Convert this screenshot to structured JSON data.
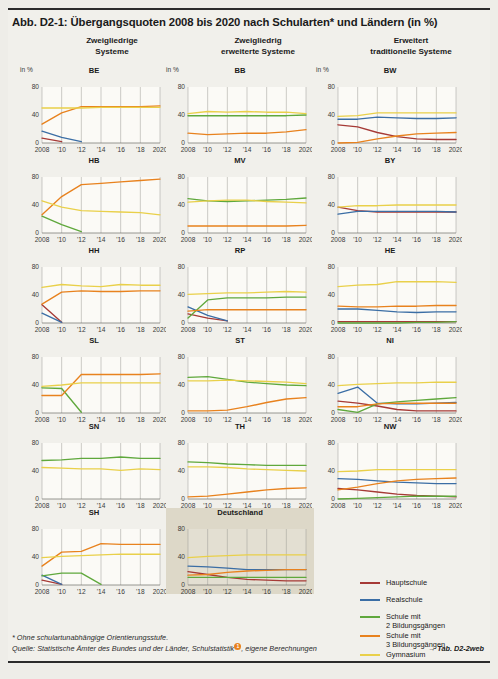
{
  "figure": {
    "title": "Abb. D2-1: Übergangsquoten 2008 bis 2020 nach Schularten* und Ländern (in %)",
    "column_headers": [
      "Zweigliedrige\nSysteme",
      "Zweigliedrig\nerweiterte Systeme",
      "Erweitert\ntraditionelle Systeme"
    ],
    "axis_unit_label": "in %",
    "y_ticks": [
      "0",
      "40",
      "80"
    ],
    "x_ticks": [
      "2008",
      "'10",
      "'12",
      "'14",
      "'16",
      "'18",
      "2020"
    ]
  },
  "legend": {
    "items": [
      {
        "label": "Hauptschule",
        "color": "#a63a36"
      },
      {
        "label": "Realschule",
        "color": "#3b6ea5"
      },
      {
        "label": "Schule mit\n2 Bildungsgängen",
        "color": "#5fa83c"
      },
      {
        "label": "Schule mit\n3 Bildungsgängen",
        "color": "#e8821e"
      },
      {
        "label": "Gymnasium",
        "color": "#e9d04a"
      }
    ]
  },
  "footer": {
    "note": "*  Ohne schulartunabhängige Orientierungsstufe.",
    "source_pre": "Quelle: Statistische Ämter des Bundes und der Länder, Schulstatistik",
    "source_marker": "1",
    "source_post": ", eigene Berechnungen",
    "link": "→ Tab. D2-2web"
  },
  "chart_data": {
    "type": "line",
    "xlabel": "",
    "ylabel": "in %",
    "x": [
      2008,
      2010,
      2012,
      2014,
      2016,
      2018,
      2020
    ],
    "xlim": [
      2008,
      2020
    ],
    "ylim": [
      0,
      80
    ],
    "yticks": [
      0,
      40,
      80
    ],
    "grid": "vertical",
    "legend_position": "right-bottom",
    "series_colors": {
      "Hauptschule": "#a63a36",
      "Realschule": "#3b6ea5",
      "Schule mit 2 Bildungsgängen": "#5fa83c",
      "Schule mit 3 Bildungsgängen": "#e8821e",
      "Gymnasium": "#e9d04a"
    },
    "panels": [
      {
        "name": "BE",
        "group": "Zweigliedrige Systeme",
        "series": [
          {
            "name": "Hauptschule",
            "values": [
              7,
              2,
              null,
              null,
              null,
              null,
              null
            ]
          },
          {
            "name": "Realschule",
            "values": [
              17,
              8,
              2,
              null,
              null,
              null,
              null
            ]
          },
          {
            "name": "Schule mit 3 Bildungsgängen",
            "values": [
              27,
              43,
              52,
              52,
              52,
              52,
              53
            ]
          },
          {
            "name": "Gymnasium",
            "values": [
              50,
              50,
              50,
              51,
              51,
              51,
              51
            ]
          }
        ]
      },
      {
        "name": "BB",
        "group": "Zweigliedrig erweiterte Systeme",
        "series": [
          {
            "name": "Schule mit 2 Bildungsgängen",
            "values": [
              39,
              39,
              39,
              39,
              39,
              39,
              40
            ]
          },
          {
            "name": "Schule mit 3 Bildungsgängen",
            "values": [
              14,
              12,
              13,
              14,
              14,
              16,
              19
            ]
          },
          {
            "name": "Gymnasium",
            "values": [
              42,
              45,
              44,
              45,
              44,
              44,
              42
            ]
          }
        ]
      },
      {
        "name": "BW",
        "group": "Erweitert traditionelle Systeme",
        "series": [
          {
            "name": "Hauptschule",
            "values": [
              26,
              23,
              15,
              9,
              6,
              5,
              5
            ]
          },
          {
            "name": "Realschule",
            "values": [
              34,
              34,
              37,
              36,
              35,
              35,
              36
            ]
          },
          {
            "name": "Schule mit 3 Bildungsgängen",
            "values": [
              0,
              1,
              6,
              10,
              13,
              14,
              15
            ]
          },
          {
            "name": "Gymnasium",
            "values": [
              38,
              39,
              43,
              43,
              43,
              43,
              43
            ]
          }
        ]
      },
      {
        "name": "HB",
        "group": "Zweigliedrige Systeme",
        "series": [
          {
            "name": "Schule mit 2 Bildungsgängen",
            "values": [
              24,
              12,
              2,
              null,
              null,
              null,
              null
            ]
          },
          {
            "name": "Schule mit 3 Bildungsgängen",
            "values": [
              26,
              52,
              69,
              71,
              73,
              75,
              77
            ]
          },
          {
            "name": "Gymnasium",
            "values": [
              46,
              37,
              32,
              31,
              30,
              29,
              26
            ]
          }
        ]
      },
      {
        "name": "MV",
        "group": "Zweigliedrig erweiterte Systeme",
        "series": [
          {
            "name": "Schule mit 2 Bildungsgängen",
            "values": [
              49,
              46,
              45,
              46,
              47,
              48,
              50
            ]
          },
          {
            "name": "Schule mit 3 Bildungsgängen",
            "values": [
              10,
              10,
              10,
              10,
              10,
              10,
              11
            ]
          },
          {
            "name": "Gymnasium",
            "values": [
              44,
              46,
              47,
              47,
              45,
              44,
              43
            ]
          }
        ]
      },
      {
        "name": "BY",
        "group": "Erweitert traditionelle Systeme",
        "series": [
          {
            "name": "Hauptschule",
            "values": [
              37,
              32,
              30,
              30,
              30,
              30,
              30
            ]
          },
          {
            "name": "Realschule",
            "values": [
              27,
              31,
              31,
              31,
              31,
              31,
              30
            ]
          },
          {
            "name": "Gymnasium",
            "values": [
              37,
              39,
              39,
              40,
              40,
              40,
              40
            ]
          }
        ]
      },
      {
        "name": "HH",
        "group": "Zweigliedrige Systeme",
        "series": [
          {
            "name": "Hauptschule",
            "values": [
              26,
              1,
              null,
              null,
              null,
              null,
              null
            ]
          },
          {
            "name": "Realschule",
            "values": [
              14,
              1,
              null,
              null,
              null,
              null,
              null
            ]
          },
          {
            "name": "Schule mit 3 Bildungsgängen",
            "values": [
              27,
              44,
              46,
              45,
              45,
              46,
              46
            ]
          },
          {
            "name": "Gymnasium",
            "values": [
              51,
              55,
              53,
              52,
              55,
              54,
              54
            ]
          }
        ]
      },
      {
        "name": "RP",
        "group": "Zweigliedrig erweiterte Systeme",
        "series": [
          {
            "name": "Hauptschule",
            "values": [
              13,
              7,
              3,
              null,
              null,
              null,
              null
            ]
          },
          {
            "name": "Realschule",
            "values": [
              23,
              11,
              3,
              null,
              null,
              null,
              null
            ]
          },
          {
            "name": "Schule mit 2 Bildungsgängen",
            "values": [
              7,
              33,
              36,
              36,
              36,
              37,
              37
            ]
          },
          {
            "name": "Schule mit 3 Bildungsgängen",
            "values": [
              17,
              19,
              19,
              19,
              19,
              19,
              19
            ]
          },
          {
            "name": "Gymnasium",
            "values": [
              41,
              42,
              43,
              43,
              44,
              45,
              44
            ]
          }
        ]
      },
      {
        "name": "HE",
        "group": "Erweitert traditionelle Systeme",
        "series": [
          {
            "name": "Hauptschule",
            "values": [
              2,
              2,
              2,
              2,
              2,
              2,
              2
            ]
          },
          {
            "name": "Realschule",
            "values": [
              20,
              20,
              18,
              16,
              15,
              16,
              16
            ]
          },
          {
            "name": "Schule mit 2 Bildungsgängen",
            "values": [
              0,
              0,
              0,
              0,
              1,
              1,
              2
            ]
          },
          {
            "name": "Schule mit 3 Bildungsgängen",
            "values": [
              24,
              23,
              23,
              24,
              24,
              25,
              25
            ]
          },
          {
            "name": "Gymnasium",
            "values": [
              52,
              54,
              55,
              59,
              59,
              59,
              58
            ]
          }
        ]
      },
      {
        "name": "SL",
        "group": "Zweigliedrige Systeme",
        "series": [
          {
            "name": "Schule mit 2 Bildungsgängen",
            "values": [
              36,
              35,
              1,
              null,
              null,
              null,
              null
            ]
          },
          {
            "name": "Schule mit 3 Bildungsgängen",
            "values": [
              25,
              25,
              55,
              55,
              55,
              55,
              56
            ]
          },
          {
            "name": "Gymnasium",
            "values": [
              38,
              40,
              43,
              43,
              43,
              43,
              43
            ]
          }
        ]
      },
      {
        "name": "ST",
        "group": "Zweigliedrig erweiterte Systeme",
        "series": [
          {
            "name": "Schule mit 2 Bildungsgängen",
            "values": [
              51,
              52,
              48,
              44,
              42,
              40,
              39
            ]
          },
          {
            "name": "Schule mit 3 Bildungsgängen",
            "values": [
              3,
              3,
              4,
              9,
              15,
              20,
              22
            ]
          },
          {
            "name": "Gymnasium",
            "values": [
              46,
              46,
              47,
              46,
              45,
              44,
              42
            ]
          }
        ]
      },
      {
        "name": "NI",
        "group": "Erweitert traditionelle Systeme",
        "series": [
          {
            "name": "Hauptschule",
            "values": [
              17,
              14,
              10,
              5,
              3,
              3,
              3
            ]
          },
          {
            "name": "Realschule",
            "values": [
              28,
              37,
              14,
              13,
              13,
              14,
              15
            ]
          },
          {
            "name": "Schule mit 2 Bildungsgängen",
            "values": [
              5,
              1,
              13,
              16,
              18,
              20,
              22
            ]
          },
          {
            "name": "Schule mit 3 Bildungsgängen",
            "values": [
              9,
              9,
              13,
              14,
              14,
              14,
              14
            ]
          },
          {
            "name": "Gymnasium",
            "values": [
              39,
              41,
              42,
              43,
              43,
              44,
              44
            ]
          }
        ]
      },
      {
        "name": "SN",
        "group": "Zweigliedrige Systeme",
        "series": [
          {
            "name": "Schule mit 2 Bildungsgängen",
            "values": [
              55,
              56,
              58,
              58,
              60,
              58,
              58
            ]
          },
          {
            "name": "Gymnasium",
            "values": [
              45,
              44,
              43,
              43,
              41,
              43,
              42
            ]
          }
        ]
      },
      {
        "name": "TH",
        "group": "Zweigliedrig erweiterte Systeme",
        "series": [
          {
            "name": "Schule mit 2 Bildungsgängen",
            "values": [
              53,
              52,
              50,
              49,
              48,
              48,
              48
            ]
          },
          {
            "name": "Schule mit 3 Bildungsgängen",
            "values": [
              3,
              4,
              7,
              10,
              13,
              15,
              16
            ]
          },
          {
            "name": "Gymnasium",
            "values": [
              46,
              46,
              45,
              43,
              42,
              41,
              40
            ]
          }
        ]
      },
      {
        "name": "NW",
        "group": "Erweitert traditionelle Systeme",
        "series": [
          {
            "name": "Hauptschule",
            "values": [
              15,
              13,
              10,
              7,
              5,
              4,
              3
            ]
          },
          {
            "name": "Realschule",
            "values": [
              29,
              28,
              26,
              24,
              23,
              22,
              22
            ]
          },
          {
            "name": "Schule mit 2 Bildungsgängen",
            "values": [
              0,
              1,
              2,
              3,
              4,
              4,
              4
            ]
          },
          {
            "name": "Schule mit 3 Bildungsgängen",
            "values": [
              13,
              17,
              22,
              26,
              28,
              29,
              30
            ]
          },
          {
            "name": "Gymnasium",
            "values": [
              39,
              40,
              42,
              42,
              42,
              42,
              42
            ]
          }
        ]
      },
      {
        "name": "SH",
        "group": "Zweigliedrige Systeme",
        "series": [
          {
            "name": "Hauptschule",
            "values": [
              7,
              1,
              null,
              null,
              null,
              null,
              null
            ]
          },
          {
            "name": "Realschule",
            "values": [
              14,
              1,
              null,
              null,
              null,
              null,
              null
            ]
          },
          {
            "name": "Schule mit 2 Bildungsgängen",
            "values": [
              13,
              17,
              17,
              1,
              null,
              null,
              null
            ]
          },
          {
            "name": "Schule mit 3 Bildungsgängen",
            "values": [
              27,
              47,
              48,
              59,
              58,
              58,
              58
            ]
          },
          {
            "name": "Gymnasium",
            "values": [
              39,
              41,
              42,
              43,
              44,
              44,
              44
            ]
          }
        ]
      },
      {
        "name": "Deutschland",
        "group": "Gesamt",
        "series": [
          {
            "name": "Hauptschule",
            "values": [
              19,
              15,
              11,
              8,
              7,
              6,
              6
            ]
          },
          {
            "name": "Realschule",
            "values": [
              27,
              26,
              24,
              22,
              22,
              22,
              22
            ]
          },
          {
            "name": "Schule mit 2 Bildungsgängen",
            "values": [
              11,
              11,
              11,
              11,
              11,
              11,
              11
            ]
          },
          {
            "name": "Schule mit 3 Bildungsgängen",
            "values": [
              14,
              15,
              18,
              20,
              21,
              22,
              22
            ]
          },
          {
            "name": "Gymnasium",
            "values": [
              39,
              41,
              42,
              43,
              43,
              43,
              43
            ]
          }
        ]
      }
    ]
  }
}
